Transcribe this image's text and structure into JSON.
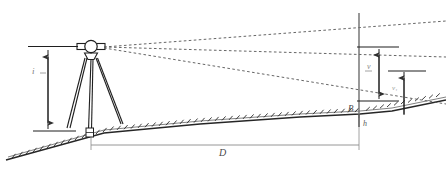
{
  "figure": {
    "type": "surveying-trigonometric-leveling-diagram",
    "width": 446,
    "height": 178,
    "background_color": "#ffffff",
    "ink_color": "#333333"
  },
  "labels": {
    "instrument_height": "i",
    "staff_upper_interval": "v",
    "staff_lower_interval": "v₁",
    "station_point": "B",
    "target_height": "h",
    "horizontal_distance": "D"
  },
  "elements": {
    "instrument": "total-station-on-tripod",
    "staff": "vertical-leveling-staff",
    "sight_lines": "three-dashed-sight-lines",
    "ground": "hatched-sloping-ground-profile"
  },
  "geometry": {
    "instrument_center": [
      91,
      47
    ],
    "staff_x": 359,
    "staff_top_y": 14,
    "staff_bottom_y": 127,
    "sight_line_targets": [
      [
        446,
        22
      ],
      [
        446,
        58
      ],
      [
        446,
        105
      ]
    ],
    "dimension_instrument_height": {
      "x": 48,
      "top": 58,
      "bottom": 127
    },
    "dimension_v": {
      "x": 379,
      "top": 48,
      "bottom": 101
    },
    "dimension_v1": {
      "x": 404,
      "top": 71,
      "bottom": 116
    },
    "dimension_D": {
      "y": 148,
      "left": 92,
      "right": 359
    }
  }
}
